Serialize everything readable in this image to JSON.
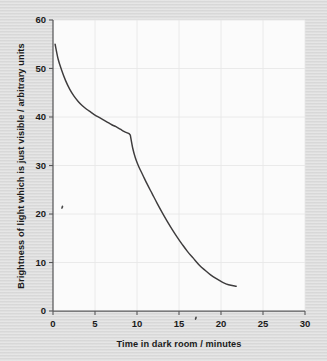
{
  "figure": {
    "background_color": "#dcdcdc",
    "plot_background_color": "#fbfbfb",
    "curve_color": "#3e3c3d",
    "axis_color": "#58585a",
    "grid_color": "#e8e8e8"
  },
  "chart_data": {
    "type": "line",
    "title": "",
    "subtitle": "",
    "xlabel": "Time in dark room / minutes",
    "ylabel": "Brightness of light which is just visible / arbitrary units",
    "xlim": [
      0,
      30
    ],
    "ylim": [
      0,
      60
    ],
    "xticks": [
      0,
      5,
      10,
      15,
      20,
      25,
      30
    ],
    "yticks": [
      0,
      10,
      20,
      30,
      40,
      50,
      60
    ],
    "xtick_labels": [
      "0",
      "5",
      "10",
      "15",
      "20",
      "25",
      "30"
    ],
    "ytick_labels": [
      "0",
      "10",
      "20",
      "30",
      "40",
      "50",
      "60"
    ],
    "grid": true,
    "legend": null,
    "legend_position": "none",
    "annotations": [
      {
        "label": "stray pencil mark",
        "x": 1.1,
        "y": 21.4
      },
      {
        "label": "stray pencil mark",
        "x": 17.0,
        "y": -1.5
      },
      {
        "label": "discontinuity / kink in curve",
        "x": 9.2,
        "y": 36.3
      }
    ],
    "series": [
      {
        "name": "Dark adaptation curve",
        "color": "#3e3c3d",
        "points": [
          [
            0.25,
            55.0
          ],
          [
            0.6,
            52.0
          ],
          [
            1.0,
            49.8
          ],
          [
            1.5,
            47.5
          ],
          [
            2.0,
            45.7
          ],
          [
            2.5,
            44.3
          ],
          [
            3.0,
            43.2
          ],
          [
            3.5,
            42.3
          ],
          [
            4.0,
            41.6
          ],
          [
            4.5,
            41.0
          ],
          [
            5.0,
            40.4
          ],
          [
            5.5,
            39.9
          ],
          [
            6.0,
            39.4
          ],
          [
            6.5,
            38.9
          ],
          [
            7.0,
            38.4
          ],
          [
            7.5,
            38.0
          ],
          [
            8.0,
            37.5
          ],
          [
            8.5,
            37.0
          ],
          [
            9.0,
            36.6
          ],
          [
            9.2,
            36.3
          ],
          [
            9.5,
            33.5
          ],
          [
            9.8,
            31.6
          ],
          [
            10.2,
            29.8
          ],
          [
            10.7,
            28.0
          ],
          [
            11.2,
            26.2
          ],
          [
            11.8,
            24.2
          ],
          [
            12.4,
            22.2
          ],
          [
            13.0,
            20.3
          ],
          [
            13.6,
            18.5
          ],
          [
            14.2,
            16.8
          ],
          [
            14.8,
            15.2
          ],
          [
            15.4,
            13.7
          ],
          [
            16.0,
            12.3
          ],
          [
            16.7,
            10.9
          ],
          [
            17.4,
            9.5
          ],
          [
            18.1,
            8.4
          ],
          [
            18.8,
            7.4
          ],
          [
            19.5,
            6.6
          ],
          [
            20.2,
            5.9
          ],
          [
            20.9,
            5.4
          ],
          [
            21.8,
            5.1
          ]
        ]
      }
    ]
  }
}
